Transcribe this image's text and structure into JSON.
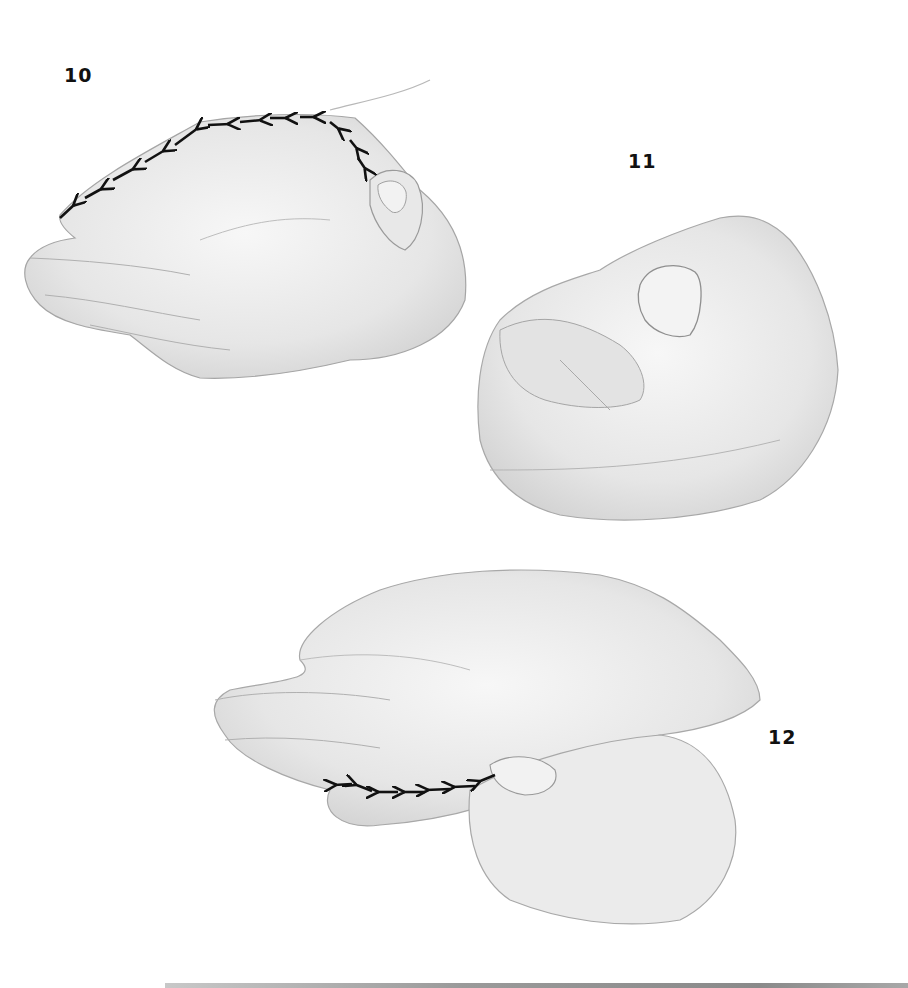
{
  "figure": {
    "panels": [
      {
        "id": "10",
        "label": "10",
        "description": "Hand palm-up with thumb of second hand pressing at base; dashed arrow path traces along top of index finger from wrist to fingertip",
        "arrow_count": 11,
        "arrow_direction": "toward fingertip (left)"
      },
      {
        "id": "11",
        "label": "11",
        "description": "Thumb pressing on fingertip pad of curled finger",
        "arrow_count": 0
      },
      {
        "id": "12",
        "label": "12",
        "description": "Hand palm-up, second hand's thumb stroking along little finger; dashed arrow path toward fingertip",
        "arrow_count": 6,
        "arrow_direction": "toward fingertip (left)"
      }
    ],
    "colors": {
      "background": "#ffffff",
      "label": "#111111",
      "arrow": "#111111",
      "sketch_shade": "#d9d9d9",
      "sketch_line": "#9a9a9a",
      "bottom_bar": "#9a9a9a"
    }
  }
}
